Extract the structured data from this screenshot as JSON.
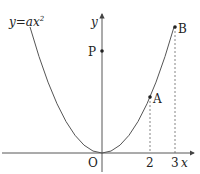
{
  "labels": {
    "equation": "y=ax",
    "equation_exp": "2",
    "y_axis": "y",
    "x_axis": "x",
    "origin": "O",
    "point_p": "P",
    "point_a": "A",
    "point_b": "B",
    "tick_2": "2",
    "tick_3": "3"
  },
  "colors": {
    "stroke": "#555555",
    "text": "#222222"
  }
}
